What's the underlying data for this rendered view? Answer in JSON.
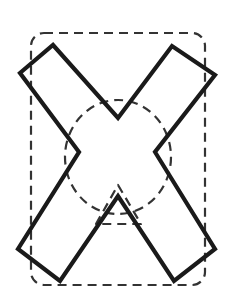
{
  "figure": {
    "caption": "plus 3 points",
    "background_color": "#ffffff",
    "stroke_color": "#1a1a1a",
    "dashed_color": "#333333",
    "solid_stroke_width": 4.2,
    "dashed_stroke_width": 2.2,
    "dash_pattern": "9,6",
    "shapes": {
      "cross": {
        "name": "x-shape-outline",
        "type": "polygon",
        "style": "solid",
        "points": "53,45 118,118 172,46 215,75 155,152 215,249 174,281 118,196 60,281 18,249 79,152 20,73"
      },
      "rounded_rect": {
        "name": "dashed-rounded-rectangle",
        "type": "rounded-rect",
        "style": "dashed",
        "x": 31,
        "y": 33,
        "width": 174,
        "height": 252,
        "rx": 13
      },
      "circle": {
        "name": "dashed-circle",
        "type": "ellipse",
        "style": "dashed",
        "cx": 118,
        "cy": 157,
        "rx": 53,
        "ry": 57
      },
      "triangle": {
        "name": "dashed-triangle",
        "type": "polygon",
        "style": "dashed",
        "points": "118,185 141,224 96,224"
      }
    }
  }
}
